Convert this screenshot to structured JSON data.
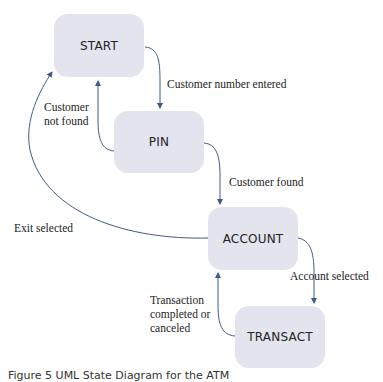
{
  "states": {
    "start": "START",
    "pin": "PIN",
    "account": "ACCOUNT",
    "transact": "TRANSACT"
  },
  "transitions": {
    "start_to_pin": "Customer number entered",
    "pin_to_start_line1": "Customer",
    "pin_to_start_line2": "not found",
    "pin_to_account": "Customer found",
    "account_to_start": "Exit selected",
    "account_to_transact": "Account selected",
    "transact_to_account_line1": "Transaction",
    "transact_to_account_line2": "completed or",
    "transact_to_account_line3": "canceled"
  },
  "caption": "Figure 5  UML State Diagram for the ATM",
  "colors": {
    "state_fill": "#e4e4ee",
    "edge": "#3f5a88"
  }
}
